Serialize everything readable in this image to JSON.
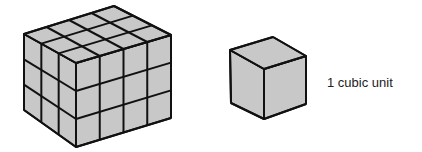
{
  "figure": {
    "type": "volume-illustration",
    "fill_color": "#c8c8c8",
    "stroke_color": "#111111",
    "large_prism": {
      "description": "rectangular prism made of unit cubes",
      "dimensions": {
        "front_left_columns": 3,
        "front_right_columns": 4,
        "rows": 3
      },
      "vertices": {
        "top_left": [
          24,
          34
        ],
        "top_back": [
          114,
          6
        ],
        "top_right": [
          171,
          35
        ],
        "top_front": [
          76,
          63
        ],
        "bottom_left": [
          24,
          110
        ],
        "bottom_front": [
          76,
          147
        ],
        "bottom_right": [
          171,
          118
        ]
      }
    },
    "unit_cube": {
      "description": "single unit cube",
      "vertices": {
        "top_left": [
          230,
          50
        ],
        "top_back": [
          273,
          37
        ],
        "top_right": [
          306,
          56
        ],
        "top_front": [
          264,
          69
        ],
        "bottom_left": [
          231,
          103
        ],
        "bottom_front": [
          264,
          119
        ],
        "bottom_right": [
          306,
          104
        ]
      }
    },
    "unit_label": "1 cubic unit"
  }
}
